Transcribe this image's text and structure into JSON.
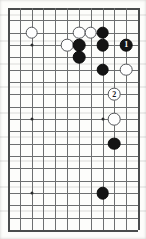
{
  "figure": {
    "kind": "go-board-diagram",
    "game": "Go",
    "title": "",
    "caption": "",
    "board": {
      "columns": 12,
      "rows": 19,
      "left_px": 8,
      "top_px": 8,
      "col_spacing_px": 11.82,
      "row_spacing_px": 12.33,
      "line_color": "#6d6f70",
      "edge_color": "#4a4c4d",
      "background_color": "#fdfdfb",
      "is_partial_view": true
    },
    "colors": {
      "black_stone": "#141414",
      "white_stone": "#fefefe",
      "white_stone_border": "#54565a",
      "black_label_text": "#ffffff",
      "white_label_text": "#17181a",
      "star_point": "#2b2c2d"
    },
    "star_points": [
      {
        "col": 2,
        "row": 3
      },
      {
        "col": 2,
        "row": 9
      },
      {
        "col": 2,
        "row": 15
      },
      {
        "col": 8,
        "row": 9
      }
    ],
    "stones": [
      {
        "color": "white",
        "col": 2,
        "row": 2,
        "label": ""
      },
      {
        "color": "white",
        "col": 6,
        "row": 2,
        "label": ""
      },
      {
        "color": "white",
        "col": 7,
        "row": 2,
        "label": ""
      },
      {
        "color": "black",
        "col": 8,
        "row": 2,
        "label": ""
      },
      {
        "color": "white",
        "col": 5,
        "row": 3,
        "label": ""
      },
      {
        "color": "black",
        "col": 6,
        "row": 3,
        "label": ""
      },
      {
        "color": "black",
        "col": 8,
        "row": 3,
        "label": ""
      },
      {
        "color": "black",
        "col": 10,
        "row": 3,
        "label": "1"
      },
      {
        "color": "black",
        "col": 6,
        "row": 4,
        "label": ""
      },
      {
        "color": "black",
        "col": 8,
        "row": 5,
        "label": ""
      },
      {
        "color": "white",
        "col": 10,
        "row": 5,
        "label": ""
      },
      {
        "color": "white",
        "col": 9,
        "row": 7,
        "label": "2"
      },
      {
        "color": "white",
        "col": 9,
        "row": 9,
        "label": ""
      },
      {
        "color": "black",
        "col": 9,
        "row": 11,
        "label": ""
      },
      {
        "color": "black",
        "col": 8,
        "row": 15,
        "label": ""
      }
    ],
    "scan_bands_y": [
      14,
      40,
      63,
      86,
      112,
      136,
      160,
      186,
      210
    ],
    "move_numbers": {
      "black_move": "1",
      "white_move": "2"
    }
  }
}
